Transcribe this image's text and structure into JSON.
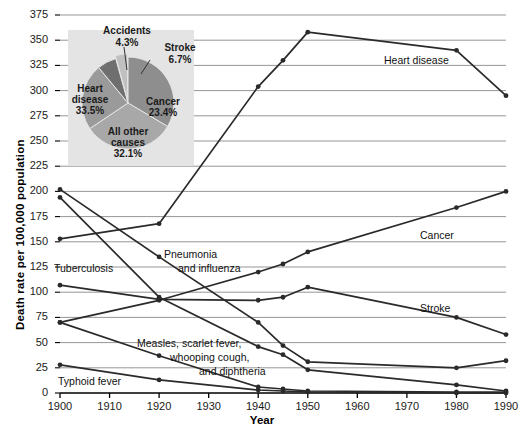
{
  "chart_data": {
    "type": "line",
    "title": "",
    "xlabel": "Year",
    "ylabel": "Death rate per 100,000 population",
    "xlim": [
      1900,
      1990
    ],
    "ylim": [
      0,
      375
    ],
    "grid": true,
    "legend": "inline-labels",
    "x_ticks": [
      1900,
      1910,
      1920,
      1930,
      1940,
      1950,
      1960,
      1970,
      1980,
      1990
    ],
    "y_ticks": [
      0,
      25,
      50,
      75,
      100,
      125,
      150,
      175,
      200,
      225,
      250,
      275,
      300,
      325,
      350,
      375
    ],
    "series": [
      {
        "name": "Heart disease",
        "label": "Heart disease",
        "x": [
          1900,
          1920,
          1940,
          1945,
          1950,
          1980,
          1990
        ],
        "values": [
          153,
          168,
          304,
          330,
          358,
          340,
          295
        ]
      },
      {
        "name": "Cancer",
        "label": "Cancer",
        "x": [
          1900,
          1920,
          1940,
          1945,
          1950,
          1980,
          1990
        ],
        "values": [
          70,
          92,
          120,
          128,
          140,
          184,
          200
        ]
      },
      {
        "name": "Stroke",
        "label": "Stroke",
        "x": [
          1900,
          1920,
          1940,
          1945,
          1950,
          1980,
          1990
        ],
        "values": [
          107,
          93,
          92,
          95,
          105,
          75,
          58
        ]
      },
      {
        "name": "Pneumonia and influenza",
        "label": "Pneumonia\nand influenza",
        "x": [
          1900,
          1920,
          1940,
          1945,
          1950,
          1980,
          1990
        ],
        "values": [
          202,
          135,
          70,
          47,
          31,
          25,
          32
        ]
      },
      {
        "name": "Tuberculosis",
        "label": "Tuberculosis",
        "x": [
          1900,
          1920,
          1940,
          1945,
          1950,
          1980,
          1990
        ],
        "values": [
          194,
          95,
          46,
          38,
          23,
          8,
          2
        ]
      },
      {
        "name": "Measles, scarlet fever, whooping cough, and diphtheria",
        "label": "Measles, scarlet fever,\nwhooping cough,\nand diphtheria",
        "x": [
          1900,
          1920,
          1940,
          1945,
          1950,
          1980,
          1990
        ],
        "values": [
          70,
          37,
          6,
          4,
          2,
          1,
          1
        ]
      },
      {
        "name": "Typhoid fever",
        "label": "Typhoid fever",
        "x": [
          1900,
          1920,
          1940,
          1945,
          1950,
          1980,
          1990
        ],
        "values": [
          28,
          13,
          3,
          2,
          1,
          0,
          0
        ]
      }
    ],
    "inset_pie": {
      "type": "pie",
      "slices": [
        {
          "label": "Heart disease",
          "percent": "33.5%",
          "value": 33.5,
          "color": "#8e8e8e"
        },
        {
          "label": "All other causes",
          "percent": "32.1%",
          "value": 32.1,
          "color": "#a8a8a8"
        },
        {
          "label": "Cancer",
          "percent": "23.4%",
          "value": 23.4,
          "color": "#9a9a9a"
        },
        {
          "label": "Stroke",
          "percent": "6.7%",
          "value": 6.7,
          "color": "#6f6f6f"
        },
        {
          "label": "Accidents",
          "percent": "4.3%",
          "value": 4.3,
          "color": "#c0c0c0"
        }
      ],
      "background": "#e4e4e4"
    }
  },
  "axes": {
    "ylabel": "Death rate per 100,000 population",
    "xlabel": "Year",
    "y_ticks": [
      "375",
      "350",
      "325",
      "300",
      "275",
      "250",
      "225",
      "200",
      "175",
      "150",
      "125",
      "100",
      "75",
      "50",
      "25",
      "0"
    ],
    "x_ticks": [
      "1900",
      "1910",
      "1920",
      "1930",
      "1940",
      "1950",
      "1960",
      "1970",
      "1980",
      "1990"
    ]
  },
  "series_labels": {
    "heart_disease": "Heart disease",
    "cancer": "Cancer",
    "stroke": "Stroke",
    "pneumonia_line1": "Pneumonia",
    "pneumonia_line2": "and influenza",
    "tuberculosis": "Tuberculosis",
    "measles_line1": "Measles, scarlet fever,",
    "measles_line2": "whooping cough,",
    "measles_line3": "and diphtheria",
    "typhoid": "Typhoid fever"
  },
  "pie_labels": {
    "accidents_name": "Accidents",
    "accidents_pct": "4.3%",
    "stroke_name": "Stroke",
    "stroke_pct": "6.7%",
    "heart_name1": "Heart",
    "heart_name2": "disease",
    "heart_pct": "33.5%",
    "cancer_name": "Cancer",
    "cancer_pct": "23.4%",
    "other_name1": "All other",
    "other_name2": "causes",
    "other_pct": "32.1%"
  },
  "colors": {
    "line": "#2a2a2a",
    "grid": "#8a8a8a",
    "axis": "#000000",
    "pie_bg": "#e4e4e4"
  }
}
